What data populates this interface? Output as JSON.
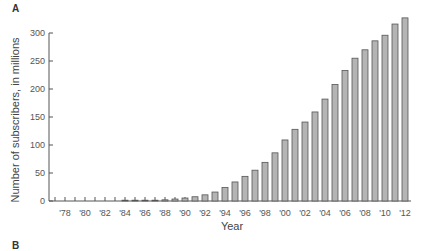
{
  "figure": {
    "panel_label": "A",
    "next_panel_label": "B"
  },
  "chart_data": {
    "type": "bar",
    "title": "",
    "xlabel": "Year",
    "ylabel": "Number of subscribers, in millions",
    "ylim": [
      0,
      300
    ],
    "yticks": [
      0,
      50,
      100,
      150,
      200,
      250,
      300
    ],
    "xtick_labels": [
      "'78",
      "'80",
      "'82",
      "'84",
      "'86",
      "'88",
      "'90",
      "'92",
      "'94",
      "'96",
      "'98",
      "'00",
      "'02",
      "'04",
      "'06",
      "'08",
      "'10",
      "'12"
    ],
    "grid": false,
    "legend": null,
    "categories": [
      1977,
      1978,
      1979,
      1980,
      1981,
      1982,
      1983,
      1984,
      1985,
      1986,
      1987,
      1988,
      1989,
      1990,
      1991,
      1992,
      1993,
      1994,
      1995,
      1996,
      1997,
      1998,
      1999,
      2000,
      2001,
      2002,
      2003,
      2004,
      2005,
      2006,
      2007,
      2008,
      2009,
      2010,
      2011,
      2012
    ],
    "values": [
      0,
      0,
      0,
      0,
      0,
      0,
      0,
      0.1,
      0.3,
      0.7,
      1.2,
      2.1,
      3.5,
      5.3,
      7.6,
      11,
      16,
      24,
      34,
      44,
      55,
      69,
      86,
      109,
      128,
      141,
      159,
      182,
      208,
      233,
      255,
      270,
      286,
      296,
      316,
      327
    ],
    "bar_fill": "#b4b4b4",
    "bar_stroke": "#555555"
  }
}
